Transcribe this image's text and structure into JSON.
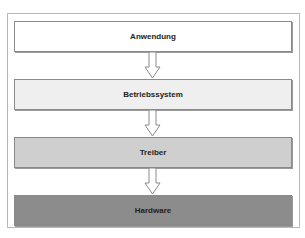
{
  "diagram": {
    "type": "layer-stack",
    "layers": [
      {
        "label": "Anwendung",
        "fill": "#ffffff"
      },
      {
        "label": "Betriebssystem",
        "fill": "#efefef"
      },
      {
        "label": "Treiber",
        "fill": "#cfcfcf"
      },
      {
        "label": "Hardware",
        "fill": "#8c8c8c"
      }
    ],
    "arrows": [
      {
        "from": "Anwendung",
        "to": "Betriebssystem"
      },
      {
        "from": "Betriebssystem",
        "to": "Treiber"
      },
      {
        "from": "Treiber",
        "to": "Hardware"
      }
    ]
  }
}
